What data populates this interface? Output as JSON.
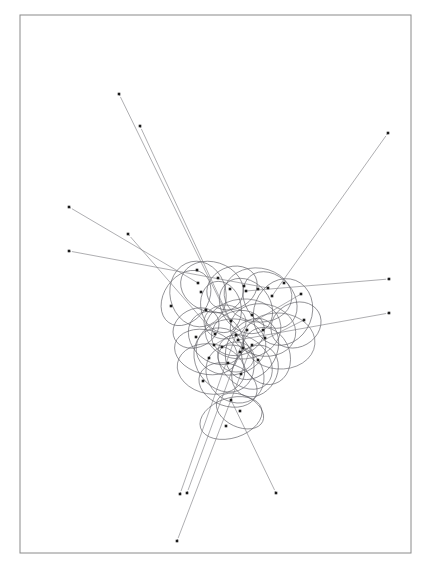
{
  "figure": {
    "title": "Abstract Node-Ellipse Diagram",
    "type": "generative-line-art",
    "canvas": {
      "width": 428,
      "height": 566,
      "background": "#ffffff"
    },
    "frame": {
      "x": 20,
      "y": 15,
      "width": 391,
      "height": 538,
      "stroke": "#8a8a8a",
      "stroke_width": 1
    },
    "style": {
      "ellipse_stroke": "#5c5c62",
      "ellipse_stroke_width": 0.6,
      "line_stroke": "#6e6e72",
      "line_stroke_width": 0.55,
      "spoke_stroke": "#77777c",
      "node_fill": "#1b1b1b",
      "node_size": 2.6
    }
  },
  "chart_data": {
    "type": "scatter",
    "title": "Abstract Node-Ellipse Diagram",
    "subtitle": "",
    "xlabel": "",
    "ylabel": "",
    "xlim": [
      20,
      411
    ],
    "ylim": [
      15,
      553
    ],
    "grid": false,
    "legend": null,
    "annotations": [],
    "tick_labels": {
      "x": [],
      "y": []
    },
    "cluster_center": [
      228,
      340
    ],
    "outer_endpoints": [
      {
        "id": "e1",
        "x": 119,
        "y": 94
      },
      {
        "id": "e2",
        "x": 140,
        "y": 126
      },
      {
        "id": "e3",
        "x": 388,
        "y": 133
      },
      {
        "id": "e4",
        "x": 69,
        "y": 207
      },
      {
        "id": "e5",
        "x": 128,
        "y": 234
      },
      {
        "id": "e6",
        "x": 69,
        "y": 251
      },
      {
        "id": "e7",
        "x": 389,
        "y": 279
      },
      {
        "id": "e8",
        "x": 389,
        "y": 313
      },
      {
        "id": "e9",
        "x": 180,
        "y": 494
      },
      {
        "id": "e10",
        "x": 187,
        "y": 493
      },
      {
        "id": "e11",
        "x": 276,
        "y": 493
      },
      {
        "id": "e12",
        "x": 177,
        "y": 541
      }
    ],
    "spokes": [
      {
        "from": [
          119,
          94
        ],
        "to": [
          243,
          348
        ]
      },
      {
        "from": [
          140,
          126
        ],
        "to": [
          231,
          322
        ]
      },
      {
        "from": [
          388,
          133
        ],
        "to": [
          272,
          296
        ]
      },
      {
        "from": [
          69,
          207
        ],
        "to": [
          198,
          283
        ]
      },
      {
        "from": [
          128,
          234
        ],
        "to": [
          215,
          334
        ]
      },
      {
        "from": [
          69,
          251
        ],
        "to": [
          268,
          288
        ]
      },
      {
        "from": [
          389,
          279
        ],
        "to": [
          246,
          291
        ]
      },
      {
        "from": [
          389,
          313
        ],
        "to": [
          238,
          340
        ]
      },
      {
        "from": [
          180,
          494
        ],
        "to": [
          236,
          335
        ]
      },
      {
        "from": [
          187,
          493
        ],
        "to": [
          247,
          330
        ]
      },
      {
        "from": [
          276,
          493
        ],
        "to": [
          231,
          400
        ]
      },
      {
        "from": [
          177,
          541
        ],
        "to": [
          252,
          345
        ]
      },
      {
        "from": [
          301,
          294
        ],
        "to": [
          214,
          345
        ]
      },
      {
        "from": [
          304,
          320
        ],
        "to": [
          240,
          352
        ]
      }
    ],
    "ellipses": [
      {
        "cx": 198,
        "cy": 294,
        "rx": 28,
        "ry": 33,
        "rot": -12
      },
      {
        "cx": 212,
        "cy": 287,
        "rx": 32,
        "ry": 25,
        "rot": 18
      },
      {
        "cx": 186,
        "cy": 298,
        "rx": 22,
        "ry": 30,
        "rot": 35
      },
      {
        "cx": 232,
        "cy": 288,
        "rx": 26,
        "ry": 21,
        "rot": -25
      },
      {
        "cx": 258,
        "cy": 295,
        "rx": 34,
        "ry": 27,
        "rot": 8
      },
      {
        "cx": 270,
        "cy": 300,
        "rx": 24,
        "ry": 31,
        "rot": -40
      },
      {
        "cx": 246,
        "cy": 306,
        "rx": 30,
        "ry": 24,
        "rot": 50
      },
      {
        "cx": 221,
        "cy": 307,
        "rx": 20,
        "ry": 26,
        "rot": -15
      },
      {
        "cx": 283,
        "cy": 312,
        "rx": 29,
        "ry": 34,
        "rot": 22
      },
      {
        "cx": 296,
        "cy": 325,
        "rx": 26,
        "ry": 22,
        "rot": -30
      },
      {
        "cx": 263,
        "cy": 330,
        "rx": 33,
        "ry": 26,
        "rot": 12
      },
      {
        "cx": 238,
        "cy": 333,
        "rx": 27,
        "ry": 22,
        "rot": -20
      },
      {
        "cx": 216,
        "cy": 338,
        "rx": 30,
        "ry": 24,
        "rot": 40
      },
      {
        "cx": 231,
        "cy": 347,
        "rx": 35,
        "ry": 28,
        "rot": -8
      },
      {
        "cx": 252,
        "cy": 349,
        "rx": 25,
        "ry": 32,
        "rot": 28
      },
      {
        "cx": 206,
        "cy": 352,
        "rx": 32,
        "ry": 22,
        "rot": 15
      },
      {
        "cx": 224,
        "cy": 360,
        "rx": 28,
        "ry": 34,
        "rot": -35
      },
      {
        "cx": 245,
        "cy": 362,
        "rx": 31,
        "ry": 23,
        "rot": 45
      },
      {
        "cx": 266,
        "cy": 356,
        "rx": 24,
        "ry": 29,
        "rot": -18
      },
      {
        "cx": 211,
        "cy": 369,
        "rx": 34,
        "ry": 25,
        "rot": 10
      },
      {
        "cx": 235,
        "cy": 374,
        "rx": 27,
        "ry": 31,
        "rot": -45
      },
      {
        "cx": 255,
        "cy": 371,
        "rx": 22,
        "ry": 27,
        "rot": 30
      },
      {
        "cx": 228,
        "cy": 385,
        "rx": 30,
        "ry": 21,
        "rot": 20
      },
      {
        "cx": 243,
        "cy": 329,
        "rx": 38,
        "ry": 30,
        "rot": -5
      },
      {
        "cx": 225,
        "cy": 322,
        "rx": 21,
        "ry": 17,
        "rot": 0
      },
      {
        "cx": 236,
        "cy": 357,
        "rx": 18,
        "ry": 15,
        "rot": 0
      },
      {
        "cx": 231,
        "cy": 418,
        "rx": 32,
        "ry": 20,
        "rot": -18
      },
      {
        "cx": 240,
        "cy": 411,
        "rx": 25,
        "ry": 16,
        "rot": 25
      },
      {
        "cx": 279,
        "cy": 341,
        "rx": 36,
        "ry": 28,
        "rot": 5
      },
      {
        "cx": 196,
        "cy": 328,
        "rx": 24,
        "ry": 19,
        "rot": -28
      }
    ],
    "nodes": [
      {
        "x": 197,
        "y": 270
      },
      {
        "x": 218,
        "y": 278
      },
      {
        "x": 230,
        "y": 289
      },
      {
        "x": 201,
        "y": 292
      },
      {
        "x": 244,
        "y": 286
      },
      {
        "x": 258,
        "y": 289
      },
      {
        "x": 272,
        "y": 296
      },
      {
        "x": 284,
        "y": 283
      },
      {
        "x": 171,
        "y": 306
      },
      {
        "x": 206,
        "y": 310
      },
      {
        "x": 252,
        "y": 315
      },
      {
        "x": 231,
        "y": 321
      },
      {
        "x": 301,
        "y": 294
      },
      {
        "x": 304,
        "y": 320
      },
      {
        "x": 215,
        "y": 334
      },
      {
        "x": 238,
        "y": 340
      },
      {
        "x": 265,
        "y": 338
      },
      {
        "x": 196,
        "y": 337
      },
      {
        "x": 222,
        "y": 347
      },
      {
        "x": 243,
        "y": 348
      },
      {
        "x": 252,
        "y": 345
      },
      {
        "x": 236,
        "y": 335
      },
      {
        "x": 247,
        "y": 330
      },
      {
        "x": 209,
        "y": 358
      },
      {
        "x": 228,
        "y": 363
      },
      {
        "x": 258,
        "y": 360
      },
      {
        "x": 241,
        "y": 374
      },
      {
        "x": 214,
        "y": 345
      },
      {
        "x": 240,
        "y": 352
      },
      {
        "x": 198,
        "y": 283
      },
      {
        "x": 246,
        "y": 291
      },
      {
        "x": 268,
        "y": 288
      },
      {
        "x": 231,
        "y": 400
      },
      {
        "x": 240,
        "y": 411
      },
      {
        "x": 226,
        "y": 426
      },
      {
        "x": 203,
        "y": 381
      },
      {
        "x": 263,
        "y": 330
      }
    ]
  }
}
